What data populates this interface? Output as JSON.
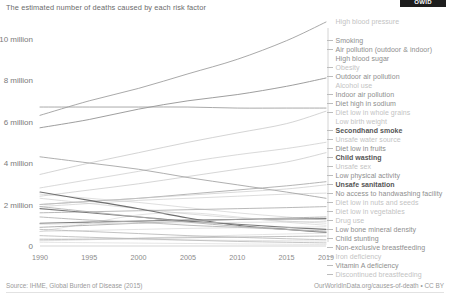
{
  "logo": {
    "text": "OWID"
  },
  "header": {
    "title": "The estimated number of deaths caused by each risk factor"
  },
  "footer": {
    "source": "Source: IHME, Global Burden of Disease (2015)",
    "attribution": "OurWorldInData.org/causes-of-death • CC BY"
  },
  "chart_data": {
    "type": "line",
    "title": "The estimated number of deaths caused by each risk factor",
    "xlabel": "",
    "ylabel": "",
    "xlim": [
      1990,
      2019
    ],
    "ylim": [
      0,
      10800000
    ],
    "grid": false,
    "legend_position": "right",
    "x": [
      1990,
      1995,
      2000,
      2005,
      2010,
      2015,
      2019
    ],
    "y_ticks": [
      0,
      2000000,
      4000000,
      6000000,
      8000000,
      10000000
    ],
    "y_tick_labels": [
      "0",
      "2 million",
      "4 million",
      "6 million",
      "8 million",
      "10 million"
    ],
    "x_ticks": [
      1990,
      1995,
      2000,
      2005,
      2010,
      2015,
      2019
    ],
    "x_tick_labels": [
      "1990",
      "1995",
      "2000",
      "2005",
      "2010",
      "2015",
      "2019"
    ],
    "series": [
      {
        "name": "High blood pressure",
        "emphasis": "normal",
        "color": "#9a9a9a",
        "values": [
          6300000,
          7000000,
          7600000,
          8300000,
          9000000,
          9900000,
          10800000
        ]
      },
      {
        "name": "Smoking",
        "emphasis": "normal",
        "color": "#8c8c8c",
        "values": [
          5700000,
          6100000,
          6600000,
          7000000,
          7300000,
          7700000,
          8100000
        ]
      },
      {
        "name": "Air pollution (outdoor & indoor)",
        "emphasis": "normal",
        "color": "#9b9b9b",
        "values": [
          6700000,
          6700000,
          6700000,
          6700000,
          6650000,
          6650000,
          6650000
        ]
      },
      {
        "name": "High blood sugar",
        "emphasis": "light",
        "color": "#bdbdbd",
        "values": [
          3450000,
          4000000,
          4500000,
          5000000,
          5450000,
          5900000,
          6500000
        ]
      },
      {
        "name": "Obesity",
        "emphasis": "light",
        "color": "#c4c4c4",
        "values": [
          2800000,
          3200000,
          3600000,
          4050000,
          4400000,
          4700000,
          5000000
        ]
      },
      {
        "name": "Outdoor air pollution",
        "emphasis": "light",
        "color": "#c0c0c0",
        "values": [
          2400000,
          2700000,
          3000000,
          3350000,
          3700000,
          4050000,
          4500000
        ]
      },
      {
        "name": "Alcohol use",
        "emphasis": "light",
        "color": "#c9c9c9",
        "values": [
          1900000,
          2050000,
          2200000,
          2300000,
          2400000,
          2500000,
          2550000
        ]
      },
      {
        "name": "Indoor air pollution",
        "emphasis": "normal",
        "color": "#a0a0a0",
        "values": [
          4300000,
          4000000,
          3700000,
          3300000,
          2950000,
          2600000,
          2300000
        ]
      },
      {
        "name": "Diet high in sodium",
        "emphasis": "normal",
        "color": "#a8a8a8",
        "values": [
          2000000,
          2150000,
          2300000,
          2500000,
          2700000,
          2900000,
          3100000
        ]
      },
      {
        "name": "Diet low in whole grains",
        "emphasis": "light",
        "color": "#c6c6c6",
        "values": [
          2000000,
          2150000,
          2300000,
          2450000,
          2600000,
          2750000,
          2950000
        ]
      },
      {
        "name": "Low birth weight",
        "emphasis": "light",
        "color": "#cecece",
        "values": [
          2500000,
          2300000,
          2100000,
          1850000,
          1600000,
          1400000,
          1250000
        ]
      },
      {
        "name": "Secondhand smoke",
        "emphasis": "bold",
        "color": "#7d7d7d",
        "values": [
          1100000,
          1150000,
          1200000,
          1250000,
          1280000,
          1300000,
          1320000
        ]
      },
      {
        "name": "Unsafe water source",
        "emphasis": "light",
        "color": "#cacaca",
        "values": [
          2300000,
          2050000,
          1800000,
          1550000,
          1350000,
          1200000,
          1100000
        ]
      },
      {
        "name": "Diet low in fruits",
        "emphasis": "normal",
        "color": "#acacac",
        "values": [
          1600000,
          1650000,
          1700000,
          1750000,
          1800000,
          1850000,
          1900000
        ]
      },
      {
        "name": "Child wasting",
        "emphasis": "bold",
        "color": "#6f6f6f",
        "values": [
          2600000,
          2200000,
          1800000,
          1350000,
          1000000,
          800000,
          650000
        ]
      },
      {
        "name": "Unsafe sex",
        "emphasis": "light",
        "color": "#d0d0d0",
        "values": [
          700000,
          1100000,
          1500000,
          1600000,
          1400000,
          1150000,
          1000000
        ]
      },
      {
        "name": "Low physical activity",
        "emphasis": "normal",
        "color": "#a6a6a6",
        "values": [
          900000,
          1000000,
          1100000,
          1200000,
          1280000,
          1350000,
          1400000
        ]
      },
      {
        "name": "Unsafe sanitation",
        "emphasis": "bold",
        "color": "#7a7a7a",
        "values": [
          1800000,
          1600000,
          1400000,
          1200000,
          1050000,
          900000,
          800000
        ]
      },
      {
        "name": "No access to handwashing facility",
        "emphasis": "normal",
        "color": "#b0b0b0",
        "values": [
          1400000,
          1250000,
          1150000,
          1000000,
          900000,
          800000,
          720000
        ]
      },
      {
        "name": "Diet low in nuts and seeds",
        "emphasis": "light",
        "color": "#d4d4d4",
        "values": [
          700000,
          750000,
          800000,
          850000,
          880000,
          900000,
          930000
        ]
      },
      {
        "name": "Diet low in vegetables",
        "emphasis": "light",
        "color": "#cfcfcf",
        "values": [
          1050000,
          1080000,
          1100000,
          1120000,
          1140000,
          1160000,
          1180000
        ]
      },
      {
        "name": "Drug use",
        "emphasis": "light",
        "color": "#d6d6d6",
        "values": [
          250000,
          300000,
          380000,
          450000,
          520000,
          580000,
          620000
        ]
      },
      {
        "name": "Low bone mineral density",
        "emphasis": "normal",
        "color": "#b4b4b4",
        "values": [
          300000,
          330000,
          370000,
          400000,
          430000,
          460000,
          480000
        ]
      },
      {
        "name": "Child stunting",
        "emphasis": "normal",
        "color": "#aeaeae",
        "values": [
          1900000,
          1650000,
          1400000,
          1150000,
          950000,
          800000,
          680000
        ]
      },
      {
        "name": "Non-exclusive breastfeeding",
        "emphasis": "normal",
        "color": "#b8b8b8",
        "values": [
          800000,
          700000,
          600000,
          500000,
          420000,
          350000,
          300000
        ]
      },
      {
        "name": "Iron deficiency",
        "emphasis": "light",
        "color": "#d2d2d2",
        "values": [
          350000,
          330000,
          310000,
          290000,
          270000,
          250000,
          240000
        ]
      },
      {
        "name": "Vitamin A deficiency",
        "emphasis": "normal",
        "color": "#bababa",
        "values": [
          500000,
          420000,
          350000,
          280000,
          220000,
          180000,
          150000
        ]
      },
      {
        "name": "Discontinued breastfeeding",
        "emphasis": "light",
        "color": "#d8d8d8",
        "values": [
          180000,
          160000,
          140000,
          120000,
          100000,
          85000,
          75000
        ]
      }
    ]
  },
  "legend": {
    "items": [
      {
        "label": "High blood pressure",
        "emphasis": "light",
        "top": 3,
        "dash": false
      },
      {
        "label": "Smoking",
        "emphasis": "normal",
        "top": 22,
        "dash": true
      },
      {
        "label": "Air pollution (outdoor & indoor)",
        "emphasis": "normal",
        "top": 31,
        "dash": true
      },
      {
        "label": "High blood sugar",
        "emphasis": "normal",
        "top": 40,
        "dash": false
      },
      {
        "label": "Obesity",
        "emphasis": "light",
        "top": 49,
        "dash": true
      },
      {
        "label": "Outdoor air pollution",
        "emphasis": "normal",
        "top": 58,
        "dash": true
      },
      {
        "label": "Alcohol use",
        "emphasis": "light",
        "top": 67,
        "dash": false
      },
      {
        "label": "Indoor air pollution",
        "emphasis": "normal",
        "top": 76,
        "dash": true
      },
      {
        "label": "Diet high in sodium",
        "emphasis": "normal",
        "top": 85,
        "dash": true
      },
      {
        "label": "Diet low in whole grains",
        "emphasis": "light",
        "top": 94,
        "dash": true
      },
      {
        "label": "Low birth weight",
        "emphasis": "light",
        "top": 103,
        "dash": false
      },
      {
        "label": "Secondhand smoke",
        "emphasis": "bold",
        "top": 112,
        "dash": true
      },
      {
        "label": "Unsafe water source",
        "emphasis": "light",
        "top": 121,
        "dash": true
      },
      {
        "label": "Diet low in fruits",
        "emphasis": "normal",
        "top": 130,
        "dash": true
      },
      {
        "label": "Child wasting",
        "emphasis": "bold",
        "top": 139,
        "dash": true
      },
      {
        "label": "Unsafe sex",
        "emphasis": "light",
        "top": 148,
        "dash": true
      },
      {
        "label": "Low physical activity",
        "emphasis": "normal",
        "top": 157,
        "dash": true
      },
      {
        "label": "Unsafe sanitation",
        "emphasis": "bold",
        "top": 166,
        "dash": true
      },
      {
        "label": "No access to handwashing facility",
        "emphasis": "normal",
        "top": 175,
        "dash": true
      },
      {
        "label": "Diet low in nuts and seeds",
        "emphasis": "light",
        "top": 184,
        "dash": true
      },
      {
        "label": "Diet low in vegetables",
        "emphasis": "light",
        "top": 193,
        "dash": true
      },
      {
        "label": "Drug use",
        "emphasis": "light",
        "top": 202,
        "dash": true
      },
      {
        "label": "Low bone mineral density",
        "emphasis": "normal",
        "top": 211,
        "dash": true
      },
      {
        "label": "Child stunting",
        "emphasis": "normal",
        "top": 220,
        "dash": true
      },
      {
        "label": "Non-exclusive breastfeeding",
        "emphasis": "normal",
        "top": 229,
        "dash": true
      },
      {
        "label": "Iron deficiency",
        "emphasis": "light",
        "top": 238,
        "dash": true
      },
      {
        "label": "Vitamin A deficiency",
        "emphasis": "normal",
        "top": 247,
        "dash": true
      },
      {
        "label": "Discontinued breastfeeding",
        "emphasis": "light",
        "top": 256,
        "dash": true
      }
    ]
  }
}
